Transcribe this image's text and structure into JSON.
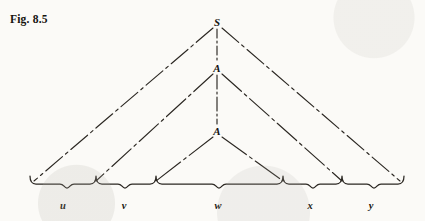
{
  "figure": {
    "label": "Fig. 8.5",
    "caption_position": "top-left"
  },
  "colors": {
    "background": "#fbfaf7",
    "ink": "#1a1713",
    "line": "#2b2722"
  },
  "diagram": {
    "type": "parse-tree-pumping-lemma",
    "nodes": [
      {
        "id": "S",
        "label": "S",
        "x": 217,
        "y": 22,
        "style": "italic-serif"
      },
      {
        "id": "A1",
        "label": "A",
        "x": 217,
        "y": 68,
        "style": "italic-serif"
      },
      {
        "id": "A2",
        "label": "A",
        "x": 217,
        "y": 131,
        "style": "italic-serif"
      }
    ],
    "spine": {
      "style": "dash-dot",
      "from": "S",
      "to": "A2",
      "segments": [
        {
          "from_y": 29,
          "to_y": 61
        },
        {
          "from_y": 75,
          "to_y": 124
        }
      ]
    },
    "triangles": [
      {
        "apex": "S",
        "left_base_x": 34,
        "right_base_x": 400,
        "base_y": 182,
        "side_style": "dash-dot"
      },
      {
        "apex": "A1",
        "left_base_x": 96,
        "right_base_x": 342,
        "base_y": 182,
        "side_style": "dash-dot"
      },
      {
        "apex": "A2",
        "left_base_x": 156,
        "right_base_x": 283,
        "base_y": 182,
        "side_style": "dash-dot"
      }
    ],
    "brace": {
      "y": 184,
      "left_x": 30,
      "right_x": 404,
      "dividers": [
        96,
        156,
        283,
        342
      ],
      "tick_height": 6
    },
    "segments": [
      {
        "name": "u",
        "label": "u",
        "center_x": 63,
        "label_y": 205,
        "from_x": 30,
        "to_x": 96
      },
      {
        "name": "v",
        "label": "v",
        "center_x": 124,
        "label_y": 205,
        "from_x": 96,
        "to_x": 156
      },
      {
        "name": "w",
        "label": "w",
        "center_x": 218,
        "label_y": 205,
        "from_x": 156,
        "to_x": 283
      },
      {
        "name": "x",
        "label": "x",
        "center_x": 310,
        "label_y": 205,
        "from_x": 283,
        "to_x": 342
      },
      {
        "name": "y",
        "label": "y",
        "center_x": 371,
        "label_y": 205,
        "from_x": 342,
        "to_x": 404
      }
    ]
  }
}
